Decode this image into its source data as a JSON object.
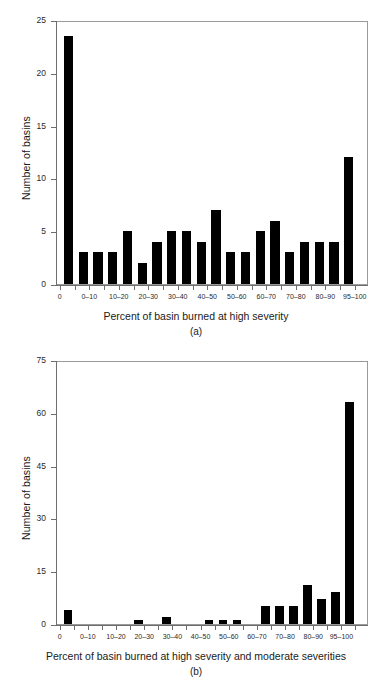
{
  "figure": {
    "panels": [
      {
        "id": "a",
        "caption": "(a)",
        "y_axis_title": "Number of basins",
        "x_axis_title": "Percent of basin burned at high severity"
      },
      {
        "id": "b",
        "caption": "(b)",
        "y_axis_title": "Number of basins",
        "x_axis_title": "Percent of basin burned at high severity and moderate severities"
      }
    ]
  },
  "chart_data": [
    {
      "type": "bar",
      "title": "",
      "panel": "(a)",
      "xlabel": "Percent of basin burned at high severity",
      "ylabel": "Number of basins",
      "ylim": [
        0,
        25
      ],
      "ytick_labels": [
        "0",
        "5",
        "10",
        "15",
        "20",
        "25"
      ],
      "ytick_values": [
        0,
        5,
        10,
        15,
        20,
        25
      ],
      "xtick_labels": [
        "0",
        "0–10",
        "10–20",
        "20–30",
        "30–40",
        "40–50",
        "50–60",
        "60–70",
        "70–80",
        "80–90",
        "95–100"
      ],
      "grid": false,
      "legend": "none",
      "bar_color": "#000000",
      "categories": [
        "0",
        "0-5",
        "5-10",
        "10-15",
        "15-20",
        "20-25",
        "25-30",
        "30-35",
        "35-40",
        "40-45",
        "45-50",
        "50-55",
        "55-60",
        "60-65",
        "65-70",
        "70-75",
        "75-80",
        "80-85",
        "85-90",
        "95-100"
      ],
      "values": [
        23.5,
        3,
        3,
        3,
        5,
        2,
        4,
        5,
        5,
        4,
        7,
        3,
        3,
        5,
        6,
        3,
        4,
        4,
        4,
        12
      ]
    },
    {
      "type": "bar",
      "title": "",
      "panel": "(b)",
      "xlabel": "Percent of basin burned at high severity and moderate severities",
      "ylabel": "Number of basins",
      "ylim": [
        0,
        75
      ],
      "ytick_labels": [
        "0",
        "15",
        "30",
        "45",
        "60",
        "75"
      ],
      "ytick_values": [
        0,
        15,
        30,
        45,
        60,
        75
      ],
      "xtick_labels": [
        "0",
        "0–10",
        "10–20",
        "20–30",
        "30–40",
        "40–50",
        "50–60",
        "60–70",
        "70–80",
        "80–90",
        "95–100"
      ],
      "grid": false,
      "legend": "none",
      "bar_color": "#000000",
      "categories": [
        "0",
        "0-5",
        "5-10",
        "10-15",
        "15-20",
        "20-25",
        "25-30",
        "30-35",
        "35-40",
        "40-45",
        "45-50",
        "50-55",
        "55-60",
        "60-65",
        "65-70",
        "70-75",
        "75-80",
        "80-85",
        "85-90",
        "95-100"
      ],
      "values": [
        4,
        0,
        0,
        0,
        0,
        1,
        0,
        2,
        0,
        0,
        1,
        1,
        1,
        0,
        5,
        5,
        5,
        11,
        7,
        9,
        63
      ]
    }
  ]
}
